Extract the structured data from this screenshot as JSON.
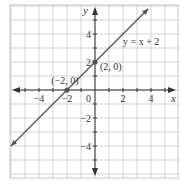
{
  "chart_data": {
    "type": "line",
    "title": "",
    "xlabel": "x",
    "ylabel": "y",
    "xlim": [
      -6,
      6
    ],
    "ylim": [
      -6.3,
      6.1
    ],
    "grid": true,
    "x_ticks": [
      -4,
      -2,
      2,
      4
    ],
    "y_ticks": [
      4,
      2,
      -2,
      -4
    ],
    "x_tick_labels": [
      "−4",
      "−2",
      "2",
      "4"
    ],
    "y_tick_labels": [
      "4",
      "2",
      "−2",
      "−4"
    ],
    "origin_label": "0",
    "series": [
      {
        "name": "y = x + 2",
        "equation": "y = x + 2",
        "x": [
          -6,
          3.8
        ],
        "y": [
          -4,
          5.8
        ],
        "arrows": "both"
      }
    ],
    "points": [
      {
        "x": -2,
        "y": 0,
        "label": "(−2, 0)"
      },
      {
        "x": 0,
        "y": 2,
        "label": "(2, 0)"
      }
    ],
    "annotations": [
      {
        "text": "y = x + 2",
        "near": [
          2.3,
          3.5
        ]
      }
    ],
    "colors": {
      "grid": "#c8c8c8",
      "axis": "#333333",
      "line": "#555555",
      "point": "#555555"
    }
  }
}
